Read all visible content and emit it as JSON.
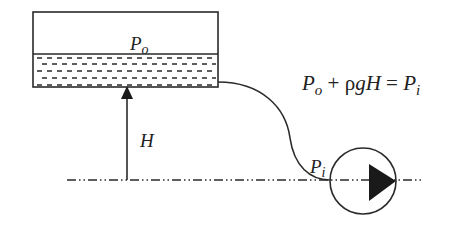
{
  "diagram": {
    "type": "hydrostatic-pump-suction",
    "colors": {
      "stroke": "#2a2a2a",
      "background": "#ffffff"
    },
    "tank": {
      "label_main": "P",
      "label_sub": "o",
      "liquid_pattern": "dashed-lines"
    },
    "height_arrow": {
      "label": "H"
    },
    "pump": {
      "label_main": "P",
      "label_sub": "i",
      "symbol": "circle-with-triangle"
    },
    "equation": {
      "t1_main": "P",
      "t1_sub": "o",
      "op1": " + ",
      "rho": "ρ",
      "g": "g",
      "H": "H",
      "op2": " = ",
      "t2_main": "P",
      "t2_sub": "i",
      "full_text": "Po + ρgH = Pi"
    },
    "centerline": {
      "style": "dash-dot-dot"
    }
  }
}
